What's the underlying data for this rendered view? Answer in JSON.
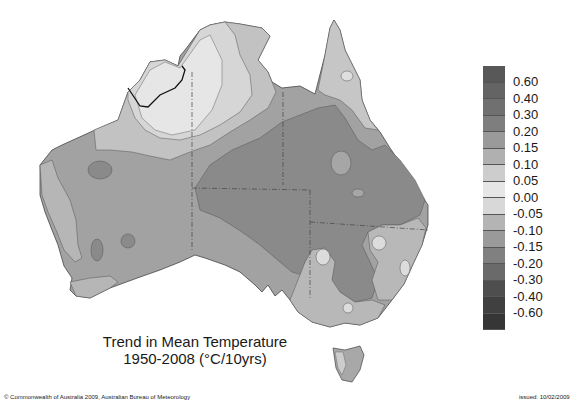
{
  "title": {
    "line1": "Trend in Mean Temperature",
    "line2": "1950-2008 (°C/10yrs)"
  },
  "footer": {
    "copyright": "© Commonwealth of Australia 2009, Australian Bureau of Meteorology",
    "issued": "issued: 10/02/2009"
  },
  "legend": {
    "labels": [
      "0.60",
      "0.40",
      "0.30",
      "0.20",
      "0.15",
      "0.10",
      "0.05",
      "0.00",
      "-0.05",
      "-0.10",
      "-0.15",
      "-0.20",
      "-0.30",
      "-0.40",
      "-0.60"
    ],
    "colors": [
      "#585858",
      "#646464",
      "#707070",
      "#7e7e7e",
      "#9a9a9a",
      "#b0b0b0",
      "#cdcdcd",
      "#e6e6e6",
      "#d8d8d8",
      "#b4b4b4",
      "#9a9a9a",
      "#808080",
      "#6a6a6a",
      "#4e4e4e",
      "#404040",
      "#363636"
    ]
  },
  "map": {
    "region": "Australia",
    "colors": {
      "base": "#a2a2a2",
      "warm_core": "#8a8a8a",
      "light_north": "#d2d2d2",
      "lightest": "#e4e4e4",
      "mid": "#b6b6b6",
      "cool_spot": "#8e8e8e"
    }
  }
}
